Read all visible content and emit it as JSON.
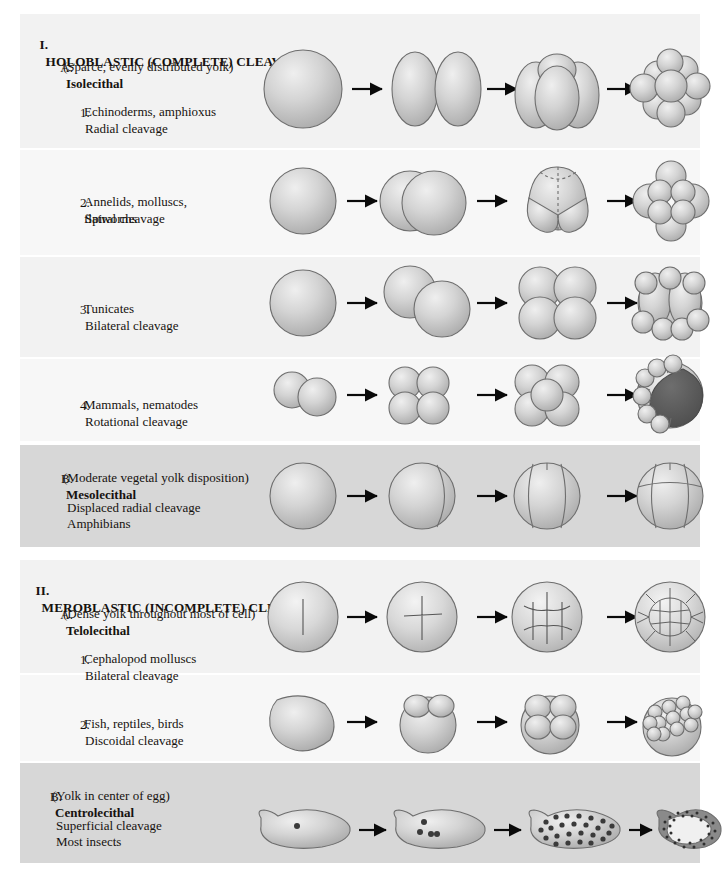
{
  "figure": {
    "title_note": "Cleavage patterns in animal embryos",
    "sections": [
      {
        "numeral": "I.",
        "heading": "HOLOBLASTIC (COMPLETE) CLEAVAGE",
        "groups": [
          {
            "letter": "A.",
            "name": "Isolecithal",
            "description": "(Sparce, evenly distributed yolk)",
            "entries": [
              {
                "number": "1.",
                "type": "Radial cleavage",
                "examples": "Echinoderms, amphioxus",
                "stages": [
                  "1-cell",
                  "2-cell",
                  "4-cell",
                  "16-cell"
                ]
              },
              {
                "number": "2.",
                "type": "Spiral cleavage",
                "examples": "Annelids, molluscs,\nflatworms",
                "stages": [
                  "1-cell",
                  "2-cell offset",
                  "4-cell spiral",
                  "multicell spiral"
                ]
              },
              {
                "number": "3.",
                "type": "Bilateral cleavage",
                "examples": "Tunicates",
                "stages": [
                  "1-cell",
                  "2-cell oblique",
                  "4-cell",
                  "multicell"
                ]
              },
              {
                "number": "4.",
                "type": "Rotational cleavage",
                "examples": "Mammals, nematodes",
                "stages": [
                  "2-cell",
                  "4-cell rotational",
                  "8-cell",
                  "blastocyst"
                ]
              }
            ]
          },
          {
            "letter": "B.",
            "name": "Mesolecithal",
            "description": "(Moderate vegetal yolk disposition)",
            "entries": [
              {
                "number": "",
                "type": "Displaced radial cleavage",
                "examples": "Amphibians",
                "stages": [
                  "1-cell",
                  "2-cell",
                  "4-cell",
                  "8-cell displaced"
                ]
              }
            ]
          }
        ]
      },
      {
        "numeral": "II.",
        "heading": "MEROBLASTIC (INCOMPLETE) CLEAVAGE",
        "groups": [
          {
            "letter": "A.",
            "name": "Telolecithal",
            "description": "(Dense yolk throughout most of cell)",
            "entries": [
              {
                "number": "1.",
                "type": "Bilateral cleavage",
                "examples": "Cephalopod molluscs",
                "stages": [
                  "single furrow",
                  "cross furrow",
                  "multiple furrows",
                  "blastodisc"
                ]
              },
              {
                "number": "2.",
                "type": "Discoidal cleavage",
                "examples": "Fish, reptiles, birds",
                "stages": [
                  "yolk mass",
                  "2-cell cap",
                  "4-cell cap",
                  "multicell cap"
                ]
              }
            ]
          },
          {
            "letter": "B.",
            "name": "Centrolecithal",
            "description": "(Yolk in center of egg)",
            "entries": [
              {
                "number": "",
                "type": "Superficial cleavage",
                "examples": "Most insects",
                "stages": [
                  "1 nucleus",
                  "4 nuclei",
                  "many nuclei",
                  "blastoderm"
                ]
              }
            ]
          }
        ]
      }
    ]
  },
  "colors": {
    "band_light": "#f2f2f2",
    "band_lighter": "#f7f7f7",
    "band_dark": "#d7d7d7",
    "cell_fill": "#c9c9c9",
    "cell_highlight": "#eaeaea",
    "cell_outline": "#6e6e6e",
    "blastocoel": "#575757",
    "text": "#16120f",
    "arrow": "#0a0a0a"
  }
}
